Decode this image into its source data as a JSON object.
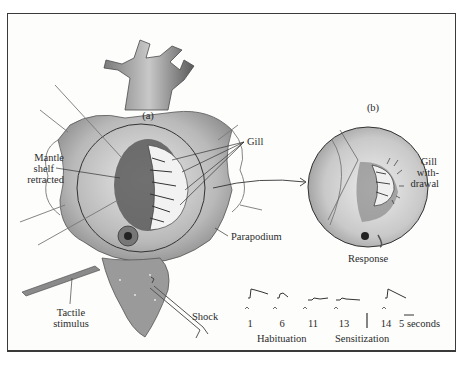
{
  "figure": {
    "panel_a_label": "(a)",
    "panel_b_label": "(b)",
    "labels": {
      "mantle_shelf_line1": "Mantle",
      "mantle_shelf_line2": "shelf",
      "mantle_shelf_line3": "retracted",
      "gill": "Gill",
      "parapodium": "Parapodium",
      "tactile_line1": "Tactile",
      "tactile_line2": "stimulus",
      "shock": "Shock",
      "gill_withdrawal_line1": "Gill",
      "gill_withdrawal_line2": "with-",
      "gill_withdrawal_line3": "drawal",
      "response": "Response"
    },
    "traces": {
      "trial_labels": [
        "1",
        "6",
        "11",
        "13",
        "14"
      ],
      "scale_bar_label": "5 seconds",
      "group_habituation": "Habituation",
      "group_sensitization": "Sensitization"
    }
  }
}
